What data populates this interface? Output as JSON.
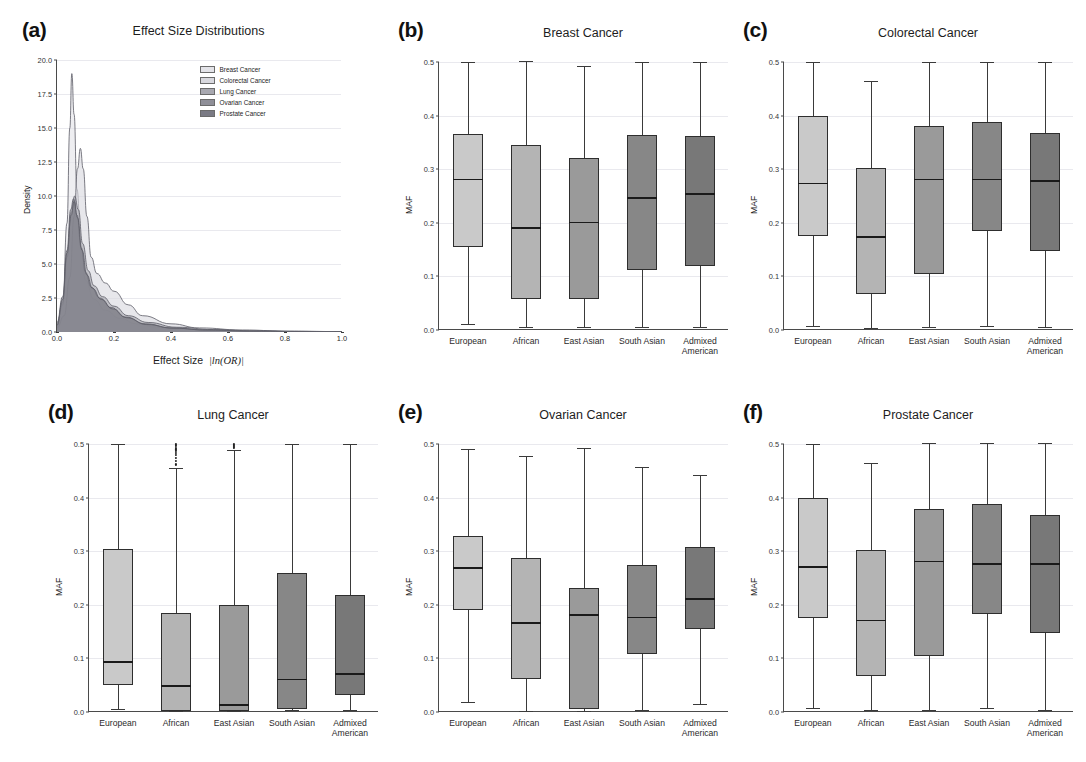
{
  "figure": {
    "width": 1086,
    "height": 762,
    "background": "#ffffff"
  },
  "panels": [
    {
      "key": "a",
      "label": "(a)",
      "title": "Effect Size Distributions",
      "type": "density"
    },
    {
      "key": "b",
      "label": "(b)",
      "title": "Breast Cancer",
      "type": "box"
    },
    {
      "key": "c",
      "label": "(c)",
      "title": "Colorectal Cancer",
      "type": "box"
    },
    {
      "key": "d",
      "label": "(d)",
      "title": "Lung Cancer",
      "type": "box"
    },
    {
      "key": "e",
      "label": "(e)",
      "title": "Ovarian Cancer",
      "type": "box"
    },
    {
      "key": "f",
      "label": "(f)",
      "title": "Prostate Cancer",
      "type": "box"
    }
  ],
  "ancestry_colors": [
    "#c9c9c9",
    "#b4b4b4",
    "#9a9a9a",
    "#878787",
    "#787878"
  ],
  "chart_data": [
    {
      "panel": "a",
      "type": "area",
      "title": "Effect Size Distributions",
      "xlabel": "Effect Size  |ln(OR)|",
      "ylabel": "Density",
      "xlim": [
        0.0,
        1.0
      ],
      "ylim": [
        0.0,
        20.0
      ],
      "xticks": [
        "0.0",
        "0.2",
        "0.4",
        "0.6",
        "0.8",
        "1.0"
      ],
      "yticks": [
        "0.0",
        "2.5",
        "5.0",
        "7.5",
        "10.0",
        "12.5",
        "15.0",
        "17.5",
        "20.0"
      ],
      "grid": true,
      "legend_position": "upper right",
      "series": [
        {
          "name": "Breast Cancer",
          "peak_x": 0.052,
          "peak_y": 19.0,
          "fill": "#e3e3e8",
          "points": [
            [
              0.0,
              0.4
            ],
            [
              0.02,
              2.0
            ],
            [
              0.035,
              8.0
            ],
            [
              0.045,
              15.0
            ],
            [
              0.052,
              19.0
            ],
            [
              0.06,
              16.0
            ],
            [
              0.07,
              10.5
            ],
            [
              0.085,
              6.0
            ],
            [
              0.1,
              3.8
            ],
            [
              0.13,
              2.4
            ],
            [
              0.17,
              1.6
            ],
            [
              0.22,
              1.0
            ],
            [
              0.28,
              0.6
            ],
            [
              0.35,
              0.35
            ],
            [
              0.45,
              0.2
            ],
            [
              0.55,
              0.12
            ],
            [
              0.7,
              0.06
            ],
            [
              0.85,
              0.03
            ],
            [
              1.0,
              0.02
            ]
          ]
        },
        {
          "name": "Colorectal Cancer",
          "peak_x": 0.082,
          "peak_y": 13.5,
          "fill": "#d8d8de",
          "points": [
            [
              0.0,
              0.3
            ],
            [
              0.025,
              1.2
            ],
            [
              0.045,
              4.0
            ],
            [
              0.06,
              8.5
            ],
            [
              0.072,
              12.0
            ],
            [
              0.082,
              13.5
            ],
            [
              0.092,
              12.0
            ],
            [
              0.105,
              8.5
            ],
            [
              0.12,
              5.5
            ],
            [
              0.14,
              4.3
            ],
            [
              0.17,
              3.6
            ],
            [
              0.2,
              3.0
            ],
            [
              0.25,
              2.0
            ],
            [
              0.3,
              1.2
            ],
            [
              0.4,
              0.6
            ],
            [
              0.5,
              0.3
            ],
            [
              0.65,
              0.15
            ],
            [
              0.8,
              0.07
            ],
            [
              1.0,
              0.03
            ]
          ]
        },
        {
          "name": "Lung Cancer",
          "peak_x": 0.062,
          "peak_y": 10.0,
          "fill": "#a8a8b0",
          "points": [
            [
              0.0,
              0.6
            ],
            [
              0.02,
              2.2
            ],
            [
              0.035,
              5.5
            ],
            [
              0.05,
              8.8
            ],
            [
              0.062,
              10.0
            ],
            [
              0.075,
              9.0
            ],
            [
              0.09,
              6.5
            ],
            [
              0.11,
              4.5
            ],
            [
              0.13,
              3.4
            ],
            [
              0.16,
              2.6
            ],
            [
              0.2,
              1.9
            ],
            [
              0.25,
              1.2
            ],
            [
              0.32,
              0.7
            ],
            [
              0.42,
              0.35
            ],
            [
              0.55,
              0.18
            ],
            [
              0.7,
              0.08
            ],
            [
              0.85,
              0.04
            ],
            [
              1.0,
              0.02
            ]
          ]
        },
        {
          "name": "Ovarian Cancer",
          "peak_x": 0.058,
          "peak_y": 9.8,
          "fill": "#8f8f98",
          "points": [
            [
              0.0,
              0.7
            ],
            [
              0.02,
              2.6
            ],
            [
              0.035,
              6.0
            ],
            [
              0.048,
              9.0
            ],
            [
              0.058,
              9.8
            ],
            [
              0.07,
              8.6
            ],
            [
              0.085,
              6.2
            ],
            [
              0.1,
              4.4
            ],
            [
              0.12,
              3.3
            ],
            [
              0.15,
              2.5
            ],
            [
              0.19,
              1.8
            ],
            [
              0.24,
              1.1
            ],
            [
              0.31,
              0.6
            ],
            [
              0.4,
              0.3
            ],
            [
              0.52,
              0.15
            ],
            [
              0.68,
              0.07
            ],
            [
              0.85,
              0.03
            ],
            [
              1.0,
              0.02
            ]
          ]
        },
        {
          "name": "Prostate Cancer",
          "peak_x": 0.06,
          "peak_y": 9.6,
          "fill": "#7a7a84",
          "points": [
            [
              0.0,
              0.5
            ],
            [
              0.02,
              2.4
            ],
            [
              0.035,
              5.8
            ],
            [
              0.05,
              8.6
            ],
            [
              0.06,
              9.6
            ],
            [
              0.072,
              8.4
            ],
            [
              0.088,
              6.0
            ],
            [
              0.105,
              4.2
            ],
            [
              0.125,
              3.2
            ],
            [
              0.155,
              2.4
            ],
            [
              0.195,
              1.7
            ],
            [
              0.245,
              1.05
            ],
            [
              0.315,
              0.55
            ],
            [
              0.41,
              0.28
            ],
            [
              0.53,
              0.14
            ],
            [
              0.69,
              0.06
            ],
            [
              0.86,
              0.03
            ],
            [
              1.0,
              0.02
            ]
          ]
        }
      ]
    },
    {
      "panel": "b",
      "type": "box",
      "title": "Breast Cancer",
      "xlabel": "",
      "ylabel": "MAF",
      "ylim": [
        0.0,
        0.5
      ],
      "yticks": [
        "0.0",
        "0.1",
        "0.2",
        "0.3",
        "0.4",
        "0.5"
      ],
      "grid": true,
      "categories": [
        "European",
        "African",
        "East Asian",
        "South Asian",
        "Admixed\nAmerican"
      ],
      "boxes": [
        {
          "label": "European",
          "whisker_low": 0.012,
          "q1": 0.155,
          "median": 0.282,
          "q3": 0.365,
          "whisker_high": 0.5,
          "outliers": []
        },
        {
          "label": "African",
          "whisker_low": 0.005,
          "q1": 0.058,
          "median": 0.192,
          "q3": 0.345,
          "whisker_high": 0.502,
          "outliers": []
        },
        {
          "label": "East Asian",
          "whisker_low": 0.005,
          "q1": 0.058,
          "median": 0.202,
          "q3": 0.32,
          "whisker_high": 0.492,
          "outliers": []
        },
        {
          "label": "South Asian",
          "whisker_low": 0.005,
          "q1": 0.112,
          "median": 0.248,
          "q3": 0.363,
          "whisker_high": 0.5,
          "outliers": []
        },
        {
          "label": "Admixed American",
          "whisker_low": 0.005,
          "q1": 0.12,
          "median": 0.255,
          "q3": 0.362,
          "whisker_high": 0.5,
          "outliers": []
        }
      ]
    },
    {
      "panel": "c",
      "type": "box",
      "title": "Colorectal Cancer",
      "xlabel": "",
      "ylabel": "MAF",
      "ylim": [
        0.0,
        0.5
      ],
      "yticks": [
        "0.0",
        "0.1",
        "0.2",
        "0.3",
        "0.4",
        "0.5"
      ],
      "grid": true,
      "categories": [
        "European",
        "African",
        "East Asian",
        "South Asian",
        "Admixed\nAmerican"
      ],
      "boxes": [
        {
          "label": "European",
          "whisker_low": 0.008,
          "q1": 0.175,
          "median": 0.275,
          "q3": 0.4,
          "whisker_high": 0.5,
          "outliers": []
        },
        {
          "label": "African",
          "whisker_low": 0.004,
          "q1": 0.068,
          "median": 0.175,
          "q3": 0.302,
          "whisker_high": 0.465,
          "outliers": []
        },
        {
          "label": "East Asian",
          "whisker_low": 0.005,
          "q1": 0.105,
          "median": 0.282,
          "q3": 0.38,
          "whisker_high": 0.5,
          "outliers": []
        },
        {
          "label": "South Asian",
          "whisker_low": 0.007,
          "q1": 0.185,
          "median": 0.282,
          "q3": 0.388,
          "whisker_high": 0.5,
          "outliers": []
        },
        {
          "label": "Admixed American",
          "whisker_low": 0.005,
          "q1": 0.147,
          "median": 0.28,
          "q3": 0.368,
          "whisker_high": 0.5,
          "outliers": []
        }
      ]
    },
    {
      "panel": "d",
      "type": "box",
      "title": "Lung Cancer",
      "xlabel": "",
      "ylabel": "MAF",
      "ylim": [
        0.0,
        0.5
      ],
      "yticks": [
        "0.0",
        "0.1",
        "0.2",
        "0.3",
        "0.4",
        "0.5"
      ],
      "grid": true,
      "categories": [
        "European",
        "African",
        "East Asian",
        "South Asian",
        "Admixed\nAmerican"
      ],
      "boxes": [
        {
          "label": "European",
          "whisker_low": 0.005,
          "q1": 0.05,
          "median": 0.095,
          "q3": 0.305,
          "whisker_high": 0.5,
          "outliers": []
        },
        {
          "label": "African",
          "whisker_low": 0.002,
          "q1": 0.002,
          "median": 0.05,
          "q3": 0.185,
          "whisker_high": 0.455,
          "outliers": [
            0.462,
            0.468,
            0.474,
            0.479,
            0.483,
            0.487,
            0.49,
            0.493,
            0.496,
            0.498,
            0.5
          ]
        },
        {
          "label": "East Asian",
          "whisker_low": 0.002,
          "q1": 0.002,
          "median": 0.015,
          "q3": 0.2,
          "whisker_high": 0.488,
          "outliers": [
            0.492,
            0.495,
            0.497,
            0.499,
            0.5
          ]
        },
        {
          "label": "South Asian",
          "whisker_low": 0.004,
          "q1": 0.005,
          "median": 0.062,
          "q3": 0.26,
          "whisker_high": 0.5,
          "outliers": []
        },
        {
          "label": "Admixed American",
          "whisker_low": 0.003,
          "q1": 0.032,
          "median": 0.072,
          "q3": 0.218,
          "whisker_high": 0.5,
          "outliers": []
        }
      ]
    },
    {
      "panel": "e",
      "type": "box",
      "title": "Ovarian Cancer",
      "xlabel": "",
      "ylabel": "MAF",
      "ylim": [
        0.0,
        0.5
      ],
      "yticks": [
        "0.0",
        "0.1",
        "0.2",
        "0.3",
        "0.4",
        "0.5"
      ],
      "grid": true,
      "categories": [
        "European",
        "African",
        "East Asian",
        "South Asian",
        "Admixed\nAmerican"
      ],
      "boxes": [
        {
          "label": "European",
          "whisker_low": 0.018,
          "q1": 0.19,
          "median": 0.27,
          "q3": 0.328,
          "whisker_high": 0.49,
          "outliers": []
        },
        {
          "label": "African",
          "whisker_low": 0.002,
          "q1": 0.062,
          "median": 0.168,
          "q3": 0.288,
          "whisker_high": 0.478,
          "outliers": []
        },
        {
          "label": "East Asian",
          "whisker_low": 0.002,
          "q1": 0.005,
          "median": 0.182,
          "q3": 0.232,
          "whisker_high": 0.492,
          "outliers": []
        },
        {
          "label": "South Asian",
          "whisker_low": 0.003,
          "q1": 0.108,
          "median": 0.178,
          "q3": 0.275,
          "whisker_high": 0.458,
          "outliers": []
        },
        {
          "label": "Admixed American",
          "whisker_low": 0.015,
          "q1": 0.155,
          "median": 0.212,
          "q3": 0.308,
          "whisker_high": 0.443,
          "outliers": []
        }
      ]
    },
    {
      "panel": "f",
      "type": "box",
      "title": "Prostate Cancer",
      "xlabel": "",
      "ylabel": "MAF",
      "ylim": [
        0.0,
        0.5
      ],
      "yticks": [
        "0.0",
        "0.1",
        "0.2",
        "0.3",
        "0.4",
        "0.5"
      ],
      "grid": true,
      "categories": [
        "European",
        "African",
        "East Asian",
        "South Asian",
        "Admixed\nAmerican"
      ],
      "boxes": [
        {
          "label": "European",
          "whisker_low": 0.008,
          "q1": 0.175,
          "median": 0.272,
          "q3": 0.4,
          "whisker_high": 0.5,
          "outliers": []
        },
        {
          "label": "African",
          "whisker_low": 0.003,
          "q1": 0.068,
          "median": 0.172,
          "q3": 0.302,
          "whisker_high": 0.465,
          "outliers": []
        },
        {
          "label": "East Asian",
          "whisker_low": 0.004,
          "q1": 0.105,
          "median": 0.282,
          "q3": 0.378,
          "whisker_high": 0.502,
          "outliers": []
        },
        {
          "label": "South Asian",
          "whisker_low": 0.008,
          "q1": 0.183,
          "median": 0.278,
          "q3": 0.388,
          "whisker_high": 0.502,
          "outliers": []
        },
        {
          "label": "Admixed American",
          "whisker_low": 0.004,
          "q1": 0.147,
          "median": 0.278,
          "q3": 0.368,
          "whisker_high": 0.502,
          "outliers": []
        }
      ]
    }
  ]
}
